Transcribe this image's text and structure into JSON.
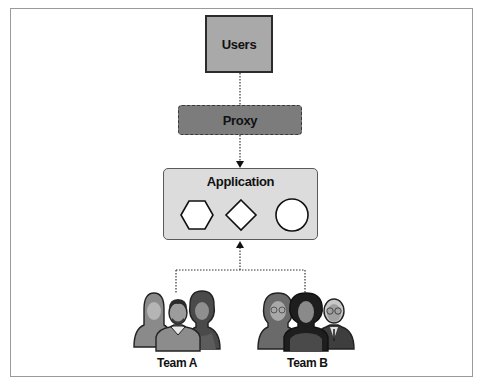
{
  "diagram": {
    "nodes": {
      "users": {
        "label": "Users"
      },
      "proxy": {
        "label": "Proxy"
      },
      "application": {
        "label": "Application",
        "shapes": [
          "hexagon",
          "diamond",
          "circle"
        ]
      }
    },
    "teams": [
      {
        "label": "Team A",
        "members": 3
      },
      {
        "label": "Team B",
        "members": 3
      }
    ],
    "edges": [
      {
        "from": "users",
        "to": "proxy",
        "style": "dotted"
      },
      {
        "from": "proxy",
        "to": "application",
        "style": "dotted",
        "arrow": "application"
      },
      {
        "from": "Team A",
        "to": "application",
        "style": "dotted",
        "arrow": "application"
      },
      {
        "from": "Team B",
        "to": "application",
        "style": "dotted",
        "arrow": "application"
      }
    ],
    "colors": {
      "users_fill": "#a9a9a9",
      "proxy_fill": "#7c7c7c",
      "application_fill": "#dcdcdc",
      "border": "#2b2b2b"
    }
  }
}
